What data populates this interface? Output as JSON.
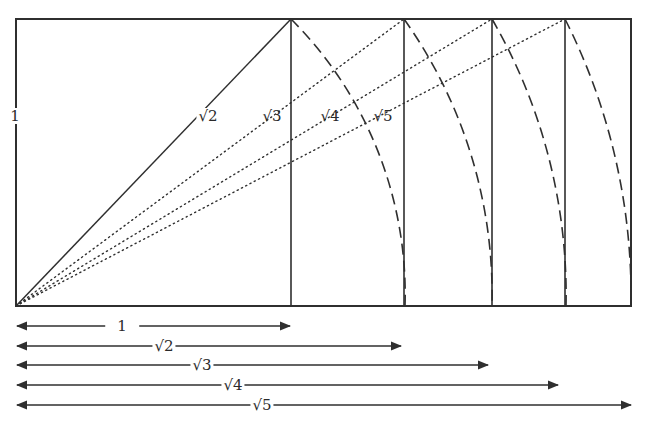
{
  "diagram": {
    "unit_px": 275,
    "origin": [
      16,
      306
    ],
    "top_y": 19,
    "colors": {
      "line": "#2f2f2f",
      "background": "#ffffff"
    },
    "side_label": "1",
    "rectangles": [
      {
        "name": "1",
        "width_ratio": 1,
        "x": 291
      },
      {
        "name": "root2",
        "width_ratio": 1.414,
        "x": 405
      },
      {
        "name": "root3",
        "width_ratio": 1.732,
        "x": 492
      },
      {
        "name": "root4",
        "width_ratio": 2.0,
        "x": 566
      },
      {
        "name": "root5",
        "width_ratio": 2.236,
        "x": 631
      }
    ],
    "diagonal_labels": [
      "√2",
      "√3",
      "√4",
      "√5"
    ],
    "arrow_labels": [
      "1",
      "√2",
      "√3",
      "√4",
      "√5"
    ]
  }
}
